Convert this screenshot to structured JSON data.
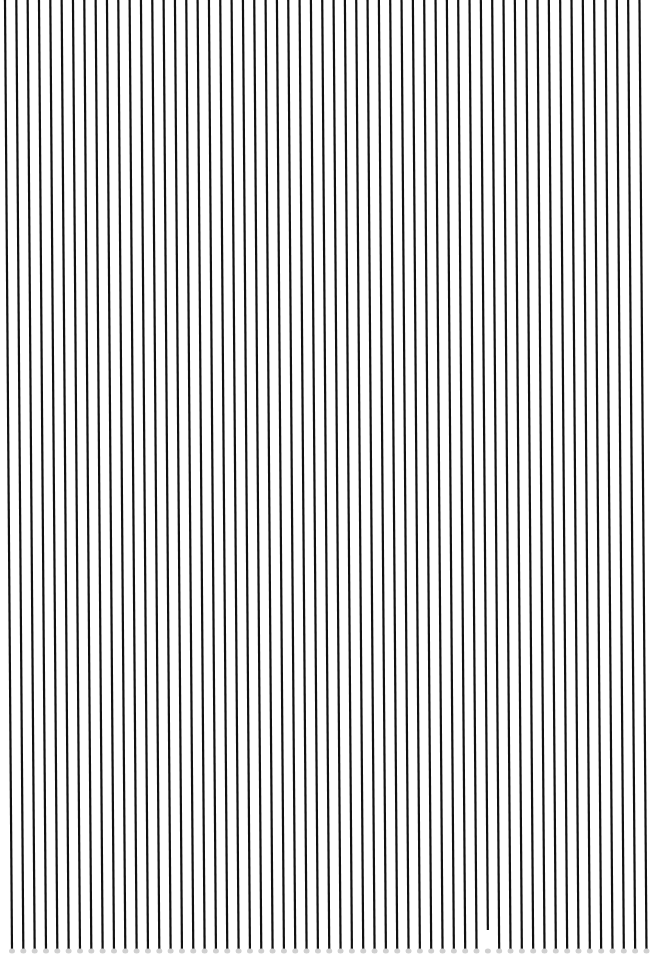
{
  "pattern": {
    "type": "vertical-line-grating",
    "background": "#ffffff",
    "line_color": "#111111",
    "end_dot_color": "#d0d0d0",
    "line_count": 57,
    "start_x_top": 5,
    "spacing": 11.33,
    "slant_px": 7,
    "line_width": 2.2,
    "top_y": 0,
    "bottom_y": 950,
    "short_lines": [
      {
        "index": 42,
        "bottom_y": 930
      }
    ]
  }
}
